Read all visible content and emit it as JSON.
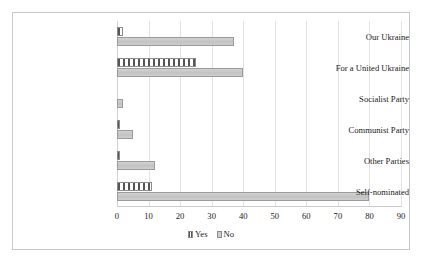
{
  "chart_data": {
    "type": "bar",
    "orientation": "horizontal",
    "title": "",
    "xlabel": "",
    "ylabel": "",
    "xlim": [
      0,
      90
    ],
    "xticks": [
      0,
      10,
      20,
      30,
      40,
      50,
      60,
      70,
      80,
      90
    ],
    "grid": true,
    "legend_position": "bottom",
    "categories": [
      "Our Ukraine",
      "For a United Ukraine",
      "Socialist Party",
      "Communist Party",
      "Other Parties",
      "Self-nominated"
    ],
    "series": [
      {
        "name": "Yes",
        "color": "#555555",
        "pattern": "vertical-stripes",
        "values": [
          2,
          25,
          0,
          1,
          1,
          11
        ]
      },
      {
        "name": "No",
        "color": "#cdcdcd",
        "pattern": "solid",
        "values": [
          37,
          40,
          2,
          5,
          12,
          80
        ]
      }
    ]
  },
  "legend": {
    "items": [
      {
        "label": "Yes",
        "swatch": "yes-hatch-swatch"
      },
      {
        "label": "No",
        "swatch": "no-solid-swatch"
      }
    ]
  }
}
